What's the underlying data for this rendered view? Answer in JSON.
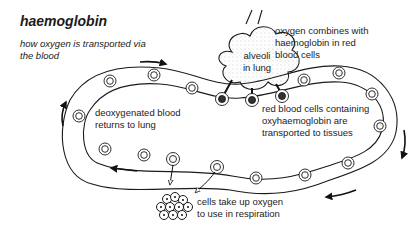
{
  "title": "haemoglobin",
  "subtitle": "how oxygen is transported via the blood",
  "labels": {
    "alveoli": [
      "alveoli",
      "in lung"
    ],
    "oxygen_combines": [
      "oxygen combines with",
      "haemoglobin in red",
      "blood cells"
    ],
    "deoxygenated": [
      "deoxygenated blood",
      "returns to lung"
    ],
    "red_cells": [
      "red blood cells containing",
      "oxyhaemoglobin are",
      "transported to tissues"
    ],
    "tissue_cells": [
      "cells take up oxygen",
      "to use in respiration"
    ]
  },
  "icons": {
    "flow_arrow": "curved-arrow",
    "blood_cell": "double-circle",
    "alveoli": "cloud-shape",
    "tissue": "cell-cluster"
  }
}
